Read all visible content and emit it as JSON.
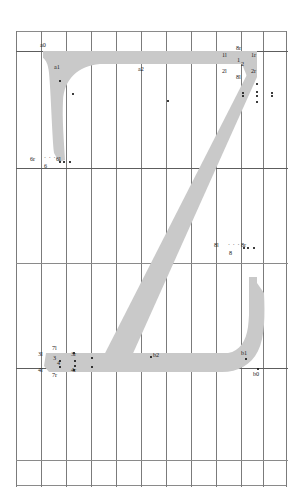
{
  "document": {
    "title": "Glyph outline proof — letter Z",
    "glyph_character": "Z",
    "fill_color": "#c9c9c9",
    "grid_color": "#8a8a8a",
    "grid_major_color": "#5d5d5d",
    "label_color": "#1b1b1b",
    "background": "#ffffff"
  },
  "grid": {
    "columns": 11,
    "rows": 5,
    "cell_width": 25,
    "left": 16,
    "top": 31,
    "width": 272,
    "height": 456,
    "vertical_lines": [
      0,
      25,
      50,
      75,
      100,
      125,
      150,
      175,
      200,
      225,
      247,
      271
    ],
    "horizontal_lines": [
      0,
      20,
      137,
      232,
      337,
      429,
      455
    ],
    "major_horizontal_lines": [
      20,
      137,
      337
    ],
    "grid_on": true
  },
  "labels": [
    {
      "name": "a0",
      "text": "a0",
      "x": 40,
      "y": 42,
      "dot_dx": 3,
      "dot_dy": 7
    },
    {
      "name": "a1",
      "text": "a1",
      "x": 54,
      "y": 64,
      "dot_dx": 2,
      "dot_dy": -2
    },
    {
      "name": "a2",
      "text": "a2",
      "x": 138,
      "y": 66,
      "dot_dx": 13,
      "dot_dy": 3
    },
    {
      "name": "1l",
      "text": "1l",
      "x": 222,
      "y": 52
    },
    {
      "name": "2l",
      "text": "2l",
      "x": 222,
      "y": 68
    },
    {
      "name": "8r",
      "text": "8r",
      "x": 236,
      "y": 45
    },
    {
      "name": "1",
      "text": "1",
      "x": 237,
      "y": 57
    },
    {
      "name": "2",
      "text": "2",
      "x": 241,
      "y": 61
    },
    {
      "name": "8l",
      "text": "8l",
      "x": 236,
      "y": 74
    },
    {
      "name": "1r",
      "text": "1r",
      "x": 251,
      "y": 52
    },
    {
      "name": "2r",
      "text": "2r",
      "x": 251,
      "y": 68
    },
    {
      "name": "6r",
      "text": "6r",
      "x": 30,
      "y": 156
    },
    {
      "name": "6l",
      "text": "6l",
      "x": 56,
      "y": 156
    },
    {
      "name": "6",
      "text": "6",
      "x": 44,
      "y": 164
    },
    {
      "name": "8l2",
      "text": "8l",
      "x": 214,
      "y": 242
    },
    {
      "name": "8r2",
      "text": "8r",
      "x": 241,
      "y": 242
    },
    {
      "name": "8",
      "text": "8",
      "x": 229,
      "y": 250
    },
    {
      "name": "3l",
      "text": "3l",
      "x": 38,
      "y": 351
    },
    {
      "name": "4l",
      "text": "4l",
      "x": 38,
      "y": 367
    },
    {
      "name": "7l",
      "text": "7l",
      "x": 52,
      "y": 345
    },
    {
      "name": "3",
      "text": "3",
      "x": 53,
      "y": 355
    },
    {
      "name": "4",
      "text": "4",
      "x": 57,
      "y": 361
    },
    {
      "name": "7r",
      "text": "7r",
      "x": 52,
      "y": 372
    },
    {
      "name": "3r",
      "text": "3r",
      "x": 71,
      "y": 351
    },
    {
      "name": "4r",
      "text": "4r",
      "x": 71,
      "y": 367
    },
    {
      "name": "b2",
      "text": "b2",
      "x": 153,
      "y": 352,
      "dot_dx": -4,
      "dot_dy": 3
    },
    {
      "name": "b1",
      "text": "b1",
      "x": 241,
      "y": 350
    },
    {
      "name": "b0",
      "text": "b0",
      "x": 253,
      "y": 372
    }
  ],
  "points": [
    {
      "name": "a0-point",
      "x": 43,
      "y": 49
    },
    {
      "name": "a1-point",
      "x": 56,
      "y": 62
    },
    {
      "name": "a2-point",
      "x": 151,
      "y": 69
    },
    {
      "name": "1l-point",
      "x": 226,
      "y": 61
    },
    {
      "name": "2l-point",
      "x": 226,
      "y": 64
    },
    {
      "name": "8r-point",
      "x": 240,
      "y": 52
    },
    {
      "name": "1-point",
      "x": 240,
      "y": 60
    },
    {
      "name": "2-point",
      "x": 240,
      "y": 64
    },
    {
      "name": "8l-point",
      "x": 240,
      "y": 70
    },
    {
      "name": "1r-point",
      "x": 255,
      "y": 61
    },
    {
      "name": "2r-point",
      "x": 255,
      "y": 64
    },
    {
      "name": "6r-point",
      "x": 43,
      "y": 160
    },
    {
      "name": "6-point",
      "x": 47,
      "y": 160
    },
    {
      "name": "6l-point",
      "x": 53,
      "y": 160
    },
    {
      "name": "8l2-point",
      "x": 227,
      "y": 247
    },
    {
      "name": "8-point",
      "x": 231,
      "y": 247
    },
    {
      "name": "8r2-point",
      "x": 237,
      "y": 247
    },
    {
      "name": "3l-point",
      "x": 43,
      "y": 360
    },
    {
      "name": "4l-point",
      "x": 43,
      "y": 366
    },
    {
      "name": "7l-point",
      "x": 57,
      "y": 352
    },
    {
      "name": "3-point",
      "x": 58,
      "y": 360
    },
    {
      "name": "4-point",
      "x": 58,
      "y": 365
    },
    {
      "name": "7r-point",
      "x": 57,
      "y": 369
    },
    {
      "name": "3r-point",
      "x": 75,
      "y": 357
    },
    {
      "name": "4r-point",
      "x": 75,
      "y": 366
    },
    {
      "name": "b2-point",
      "x": 150,
      "y": 356
    },
    {
      "name": "b1-point",
      "x": 245,
      "y": 358
    },
    {
      "name": "b0-point",
      "x": 257,
      "y": 368
    }
  ],
  "guide_dots": {
    "row6": {
      "name": "guide-dots-6",
      "text": "· · ·",
      "x": 44,
      "y": 157
    },
    "row8": {
      "name": "guide-dots-8",
      "text": "· · ·",
      "x": 228,
      "y": 244
    }
  },
  "glyph_outline": {
    "type": "filled-region",
    "description": "Letter Z: top horizontal bar with left descending stem, long diagonal, bottom horizontal bar with right ascending terminal",
    "svg_viewbox": "0 0 272 456",
    "path": "M 27 20 L 27 26 C 27 26 32 28 33 40 C 34 54 35 100 37 120 L 42 130 L 48 129 C 48 129 46 90 47 68 C 48 46 60 36 82 33 L 218 33 L 229 43 L 238 30 L 241 20 Z M 241 20 L 241 34 L 110 336 L 98 338 L 152 338 L 207 338 C 207 338 219 336 226 322 C 233 308 233 290 233 275 L 241 266 L 248 275 C 248 275 250 300 243 318 C 236 336 224 341 208 341 L 32 341 L 27 335 L 28 330 L 195 20 Z"
  }
}
